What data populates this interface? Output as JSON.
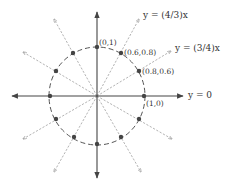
{
  "diagram": {
    "type": "unit-circle-rational-points",
    "center_px": [
      97,
      96
    ],
    "radius_px": 48,
    "colors": {
      "axis": "#444444",
      "ray": "#9a9a9a",
      "circle": "#555555",
      "point": "#444444",
      "text": "#333333"
    },
    "axes": {
      "horizontal_label": "y = 0"
    },
    "line_labels": [
      {
        "id": "line-4-3",
        "text": "y = (4/3)x"
      },
      {
        "id": "line-3-4",
        "text": "y = (3/4)x"
      },
      {
        "id": "line-0",
        "text": "y = 0"
      }
    ],
    "point_labels": [
      {
        "id": "p-0-1",
        "text": "(0,1)"
      },
      {
        "id": "p-06-08",
        "text": "(0.6,0.8)"
      },
      {
        "id": "p-08-06",
        "text": "(0.8,0.6)"
      },
      {
        "id": "p-1-0",
        "text": "(1,0)"
      }
    ],
    "points": [
      [
        0,
        1
      ],
      [
        0.6,
        0.8
      ],
      [
        0.8,
        0.6
      ],
      [
        1,
        0
      ],
      [
        0.8,
        -0.6
      ],
      [
        0.6,
        -0.8
      ],
      [
        0,
        -1
      ],
      [
        -0.6,
        -0.8
      ],
      [
        -0.8,
        -0.6
      ],
      [
        -1,
        0
      ],
      [
        -0.8,
        0.6
      ],
      [
        -0.6,
        0.8
      ]
    ]
  }
}
